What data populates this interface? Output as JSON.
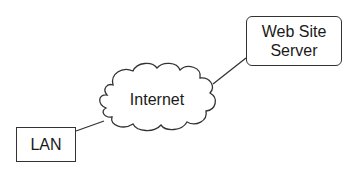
{
  "diagram": {
    "type": "network",
    "nodes": [
      {
        "id": "web-server",
        "label_line1": "Web Site",
        "label_line2": "Server",
        "shape": "rounded-rectangle"
      },
      {
        "id": "internet",
        "label": "Internet",
        "shape": "cloud"
      },
      {
        "id": "lan",
        "label": "LAN",
        "shape": "rectangle"
      }
    ],
    "edges": [
      {
        "from": "lan",
        "to": "internet"
      },
      {
        "from": "internet",
        "to": "web-server"
      }
    ],
    "colors": {
      "stroke": "#333333",
      "text": "#1a1a1a",
      "background": "#ffffff"
    }
  }
}
